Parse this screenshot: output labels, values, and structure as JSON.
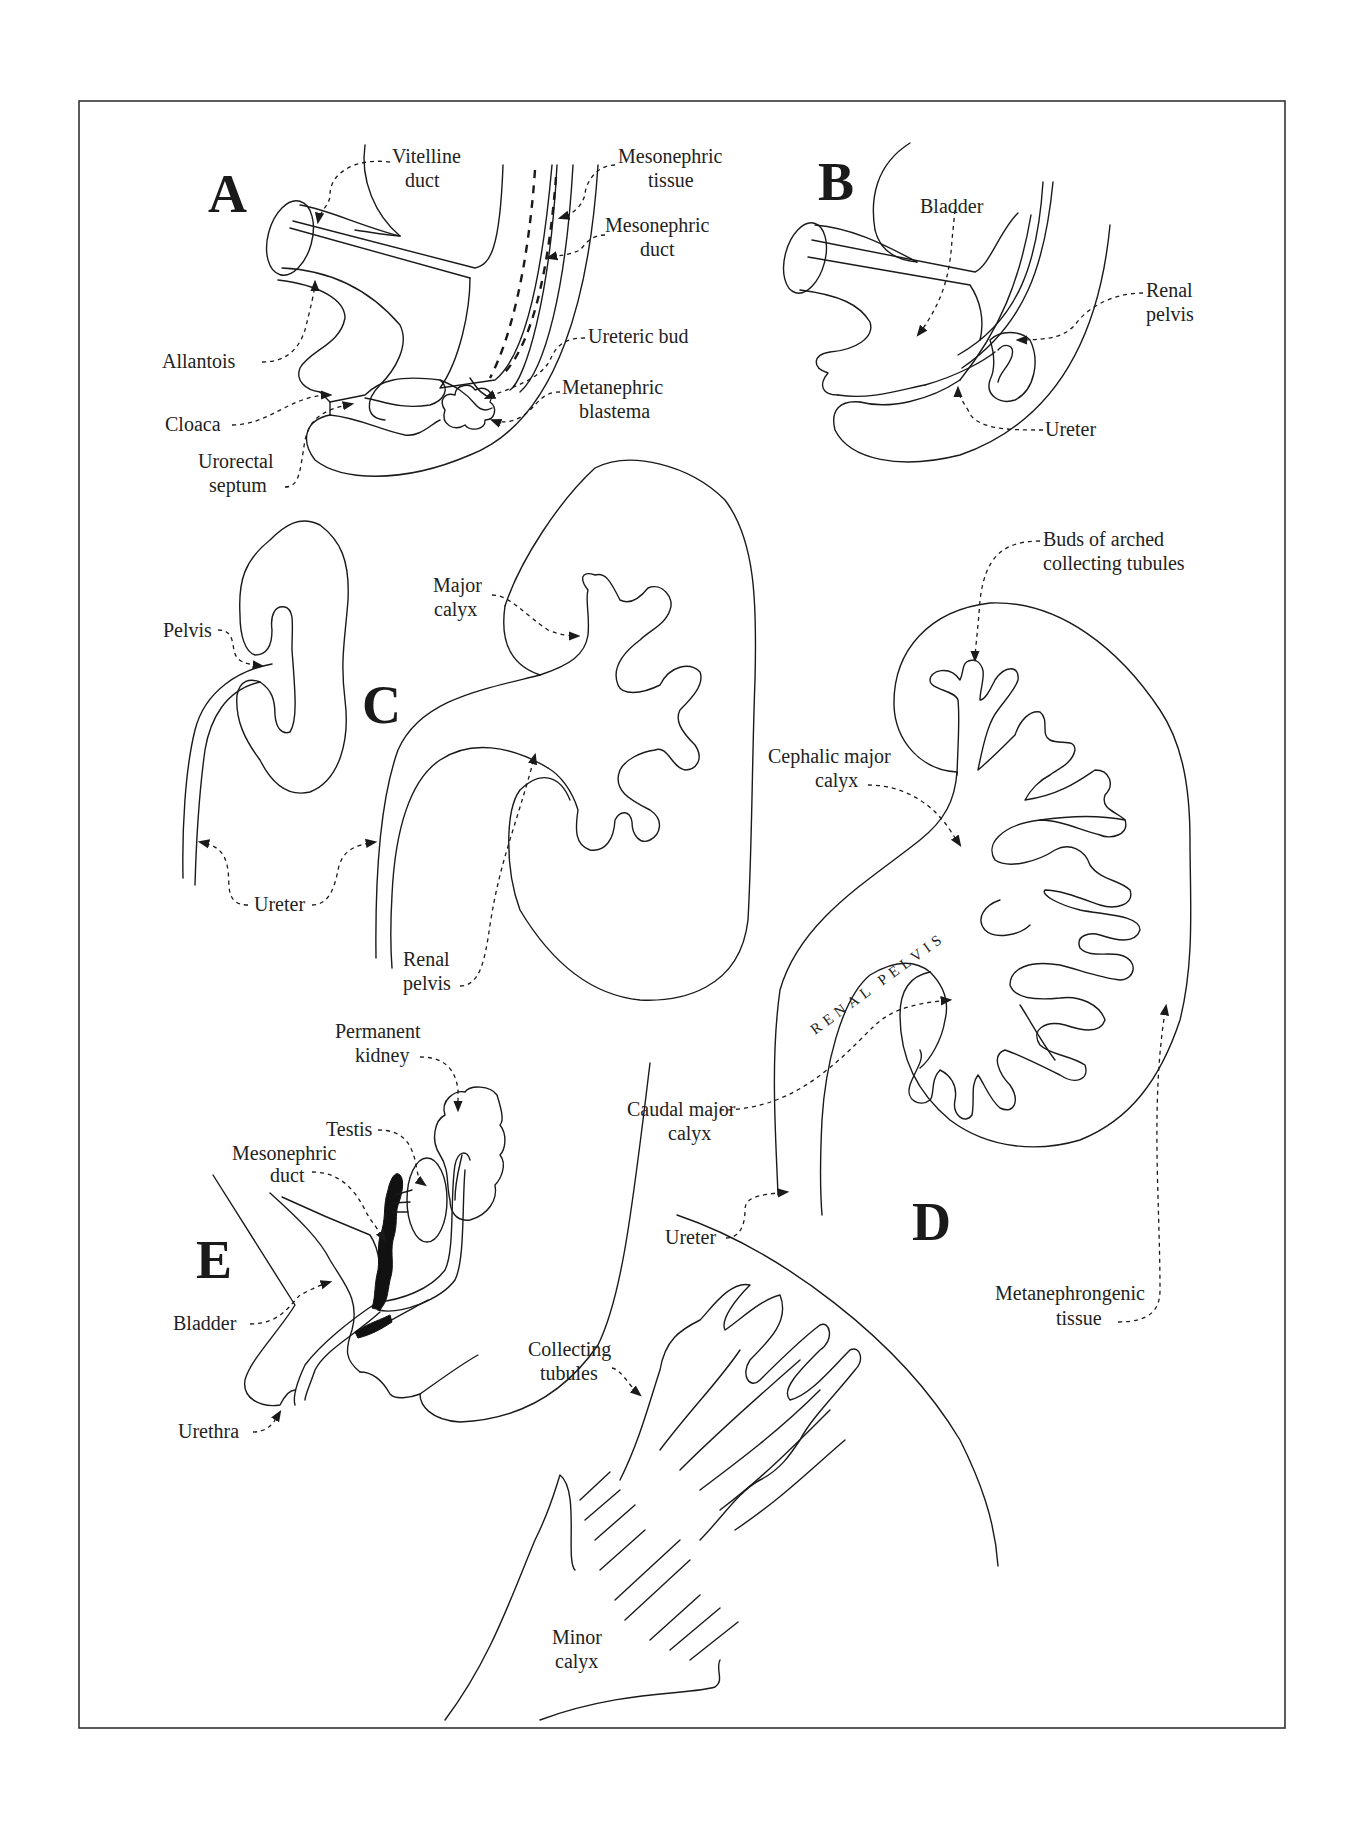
{
  "figure": {
    "panels": [
      {
        "id": "A",
        "letter": "A",
        "labels": {
          "vitelline_duct": [
            "Vitelline",
            "duct"
          ],
          "mesonephric_tissue": [
            "Mesonephric",
            "tissue"
          ],
          "mesonephric_duct": [
            "Mesonephric",
            "duct"
          ],
          "allantois": "Allantois",
          "ureteric_bud": "Ureteric bud",
          "metanephric_blastema": [
            "Metanephric",
            "blastema"
          ],
          "cloaca": "Cloaca",
          "urorectal_septum": [
            "Urorectal",
            "septum"
          ]
        }
      },
      {
        "id": "B",
        "letter": "B",
        "labels": {
          "bladder": "Bladder",
          "renal_pelvis": [
            "Renal",
            "pelvis"
          ],
          "ureter": "Ureter"
        }
      },
      {
        "id": "C",
        "letter": "C",
        "labels": {
          "pelvis": "Pelvis",
          "major_calyx": [
            "Major",
            "calyx"
          ],
          "ureter": "Ureter",
          "renal_pelvis": [
            "Renal",
            "pelvis"
          ]
        }
      },
      {
        "id": "D",
        "letter": "D",
        "labels": {
          "buds": [
            "Buds of arched",
            "collecting tubules"
          ],
          "cephalic_major_calyx": [
            "Cephalic major",
            "calyx"
          ],
          "renal_pelvis_caps": "RENAL PELVIS",
          "caudal_major_calyx": [
            "Caudal major",
            "calyx"
          ],
          "ureter": "Ureter",
          "metanephrongenic_tissue": [
            "Metanephrongenic",
            "tissue"
          ]
        }
      },
      {
        "id": "E",
        "letter": "E",
        "labels": {
          "permanent_kidney": [
            "Permanent",
            "kidney"
          ],
          "testis": "Testis",
          "mesonephric_duct": [
            "Mesonephric",
            "duct"
          ],
          "bladder": "Bladder",
          "urethra": "Urethra",
          "collecting_tubules": [
            "Collecting",
            "tubules"
          ],
          "minor_calyx": [
            "Minor",
            "calyx"
          ]
        }
      }
    ],
    "colors": {
      "line": "#1a1a1a",
      "frame": "#333333",
      "background": "#ffffff"
    }
  }
}
